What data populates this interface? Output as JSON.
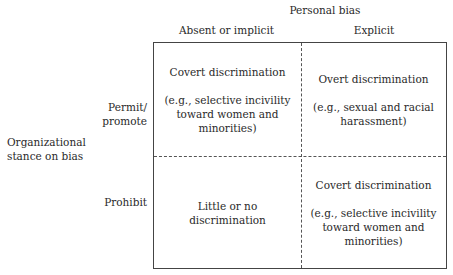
{
  "title": "Personal bias",
  "columns": [
    "Absent or implicit",
    "Explicit"
  ],
  "row_axis_label": [
    "Organizational",
    "stance on bias"
  ],
  "rows": [
    {
      "label_lines": [
        "Permit/",
        "promote"
      ]
    },
    {
      "label_lines": [
        "Prohibit"
      ]
    }
  ],
  "cells": {
    "r0c0": {
      "heading": "Covert discrimination",
      "example_lines": [
        "(e.g., selective incivility",
        "toward women and",
        "minorities)"
      ]
    },
    "r0c1": {
      "heading": "Overt discrimination",
      "example_lines": [
        "(e.g., sexual and racial",
        "harassment)"
      ]
    },
    "r1c0": {
      "heading_lines": [
        "Little or no",
        "discrimination"
      ]
    },
    "r1c1": {
      "heading": "Covert discrimination",
      "example_lines": [
        "(e.g., selective incivility",
        "toward women and",
        "minorities)"
      ]
    }
  }
}
